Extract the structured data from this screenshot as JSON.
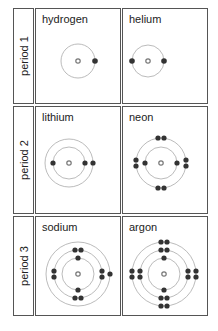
{
  "rows": [
    {
      "period": "period 1",
      "elements": [
        {
          "name": "hydrogen",
          "shells": [
            1
          ]
        },
        {
          "name": "helium",
          "shells": [
            2
          ]
        }
      ]
    },
    {
      "period": "period 2",
      "elements": [
        {
          "name": "lithium",
          "shells": [
            2,
            1
          ]
        },
        {
          "name": "neon",
          "shells": [
            2,
            8
          ]
        }
      ]
    },
    {
      "period": "period 3",
      "elements": [
        {
          "name": "sodium",
          "shells": [
            2,
            8,
            1
          ]
        },
        {
          "name": "argon",
          "shells": [
            2,
            8,
            8
          ]
        }
      ]
    }
  ],
  "colors": {
    "electron": "#333333",
    "nucleus": "#888888",
    "orbit": "#aaaaaa",
    "border": "#555555"
  }
}
